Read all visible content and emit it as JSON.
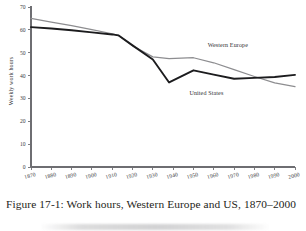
{
  "figure": {
    "caption": "Figure 17-1: Work hours, Western Europe and US, 1870–2000",
    "background_color": "#ffffff",
    "axis_color": "#6e6e72"
  },
  "chart_data": {
    "type": "line",
    "title": "",
    "subtitle": "",
    "xlabel": "",
    "ylabel": "Weekly work hours",
    "xlim": [
      1870,
      2000
    ],
    "ylim": [
      0,
      70
    ],
    "grid": false,
    "legend_position": "inline-annotation",
    "x_ticks": [
      1870,
      1880,
      1890,
      1900,
      1910,
      1920,
      1930,
      1940,
      1950,
      1960,
      1970,
      1980,
      1990,
      2000
    ],
    "x_tick_labels": [
      "1870",
      "1880",
      "1890",
      "1900",
      "1910",
      "1920",
      "1930",
      "1940",
      "1950",
      "1960",
      "1970",
      "1980",
      "1990",
      "2000"
    ],
    "y_ticks": [
      0,
      10,
      20,
      30,
      40,
      50,
      60,
      70
    ],
    "y_tick_labels": [
      "0",
      "10",
      "20",
      "30",
      "40",
      "50",
      "60",
      "70"
    ],
    "series": [
      {
        "name": "Western Europe",
        "color": "#8d8d90",
        "line_width": 1.25,
        "label_x": 1957,
        "label_y": 52.5,
        "x": [
          1870,
          1880,
          1890,
          1900,
          1910,
          1913,
          1920,
          1930,
          1938,
          1950,
          1960,
          1970,
          1980,
          1990,
          2000
        ],
        "values": [
          65.0,
          63.4,
          61.8,
          60.1,
          58.3,
          57.6,
          53.0,
          48.2,
          47.4,
          47.8,
          45.6,
          42.6,
          39.6,
          36.8,
          35.2
        ]
      },
      {
        "name": "United States",
        "color": "#1c1c1e",
        "line_width": 1.9,
        "label_x": 1948,
        "label_y": 31.5,
        "x": [
          1870,
          1880,
          1890,
          1900,
          1910,
          1913,
          1920,
          1930,
          1938,
          1950,
          1960,
          1970,
          1980,
          1990,
          2000
        ],
        "values": [
          61.2,
          60.6,
          59.8,
          58.9,
          58.0,
          57.6,
          53.2,
          47.0,
          37.0,
          42.3,
          40.4,
          38.6,
          39.0,
          39.4,
          40.3
        ]
      }
    ]
  }
}
